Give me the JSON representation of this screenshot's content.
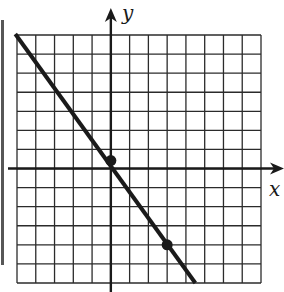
{
  "chart_data": {
    "type": "line",
    "title": "",
    "xlabel": "x",
    "ylabel": "y",
    "xlim": [
      -5,
      8
    ],
    "ylim": [
      -6,
      7
    ],
    "grid": true,
    "grid_step": 1,
    "tick_labels": false,
    "legend": null,
    "series": [
      {
        "name": "line",
        "slope": -1.3333,
        "intercept": 0,
        "x": [
          -5.25,
          4.5
        ],
        "y": [
          7,
          -6
        ]
      }
    ],
    "points": [
      {
        "x": 0,
        "y": 0
      },
      {
        "x": 3,
        "y": -4
      }
    ]
  },
  "labels": {
    "x_axis": "x",
    "y_axis": "y"
  },
  "colors": {
    "ink": "#1a1a1a",
    "grid": "#2b2b2b",
    "background": "#ffffff"
  }
}
